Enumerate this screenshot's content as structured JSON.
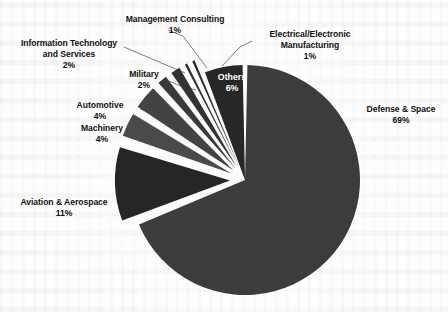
{
  "chart_data": {
    "type": "pie",
    "title": "",
    "subtitle": "",
    "xlabel": "",
    "ylabel": "",
    "legend_position": "none",
    "grid": false,
    "units": "percent",
    "total": 100,
    "categories": [
      "Defense & Space",
      "Aviation & Aerospace",
      "Machinery",
      "Automotive",
      "Military",
      "Information Technology and Services",
      "Management Consulting",
      "Electrical/Electronic Manufacturing",
      "Others"
    ],
    "values": [
      69,
      11,
      4,
      4,
      2,
      2,
      1,
      1,
      6
    ],
    "slices": [
      {
        "label": "Defense & Space",
        "value": 69,
        "value_text": "69%",
        "color": "#3c3c3c",
        "exploded": false,
        "label_placement": "outside-right"
      },
      {
        "label": "Aviation & Aerospace",
        "value": 11,
        "value_text": "11%",
        "color": "#262626",
        "exploded": true,
        "label_placement": "outside-left"
      },
      {
        "label": "Machinery",
        "value": 4,
        "value_text": "4%",
        "color": "#4a4a4a",
        "exploded": true,
        "label_placement": "outside-left"
      },
      {
        "label": "Automotive",
        "value": 4,
        "value_text": "4%",
        "color": "#434343",
        "exploded": true,
        "label_placement": "outside-left"
      },
      {
        "label": "Military",
        "value": 2,
        "value_text": "2%",
        "color": "#3a3a3a",
        "exploded": true,
        "label_placement": "outside-left"
      },
      {
        "label": "Information Technology and Services",
        "value": 2,
        "value_text": "2%",
        "color": "#333333",
        "exploded": true,
        "label_placement": "outside-left"
      },
      {
        "label": "Management Consulting",
        "value": 1,
        "value_text": "1%",
        "color": "#2e2e2e",
        "exploded": true,
        "label_placement": "outside-top"
      },
      {
        "label": "Electrical/Electronic Manufacturing",
        "value": 1,
        "value_text": "1%",
        "color": "#2a2a2a",
        "exploded": true,
        "label_placement": "outside-right"
      },
      {
        "label": "Others",
        "value": 6,
        "value_text": "6%",
        "color": "#272727",
        "exploded": false,
        "label_placement": "inside"
      }
    ]
  },
  "labels": {
    "defense_space": {
      "name": "Defense & Space",
      "pct": "69%"
    },
    "aviation_aerospace": {
      "name": "Aviation & Aerospace",
      "pct": "11%"
    },
    "machinery": {
      "name": "Machinery",
      "pct": "4%"
    },
    "automotive": {
      "name": "Automotive",
      "pct": "4%"
    },
    "military": {
      "name": "Military",
      "pct": "2%"
    },
    "info_tech": {
      "name_line1": "Information Technology",
      "name_line2": "and Services",
      "pct": "2%"
    },
    "management_consulting": {
      "name": "Management Consulting",
      "pct": "1%"
    },
    "electrical_electronic": {
      "name_line1": "Electrical/Electronic",
      "name_line2": "Manufacturing",
      "pct": "1%"
    },
    "others": {
      "name": "Others",
      "pct": "6%"
    }
  },
  "style": {
    "slice_gap_color": "#ffffff",
    "background": "#fdfdfd",
    "label_color": "#111111",
    "inside_label_color": "#ffffff",
    "leader_line_color": "#6d6d6d"
  }
}
